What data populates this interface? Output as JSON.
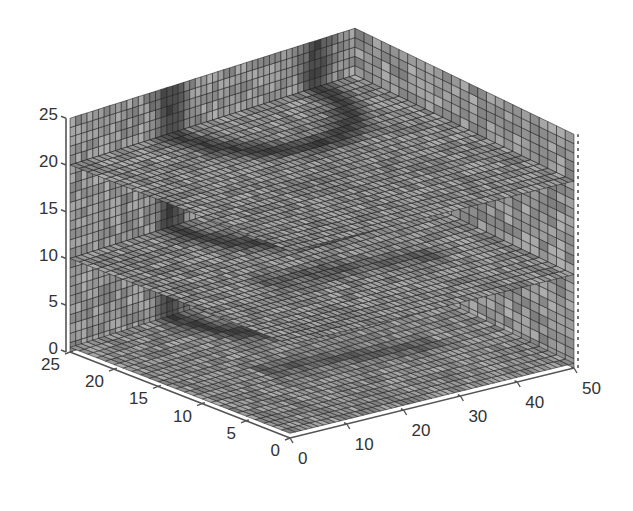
{
  "chart_data": {
    "type": "slice3d",
    "title": "",
    "xlabel": "",
    "ylabel": "",
    "zlabel": "",
    "xlim": [
      0,
      50
    ],
    "ylim": [
      0,
      25
    ],
    "zlim": [
      0,
      25
    ],
    "x_ticks": [
      0,
      10,
      20,
      30,
      40,
      50
    ],
    "y_ticks": [
      0,
      5,
      10,
      15,
      20,
      25
    ],
    "z_ticks": [
      0,
      5,
      10,
      15,
      20,
      25
    ],
    "grid_resolution": 1,
    "colormap": "gray",
    "slices": [
      {
        "plane": "x",
        "value": 50
      },
      {
        "plane": "y",
        "value": 25
      },
      {
        "plane": "z",
        "value": 20
      },
      {
        "plane": "z",
        "value": 10
      },
      {
        "plane": "z",
        "value": 0.5
      }
    ],
    "annotations": "Dark band features visible on slices forming a curved ridge near x≈20-35, y≈15-25",
    "grid": "dotted floor grid lines at axis ticks",
    "box": false
  },
  "projection": {
    "origin": [
      290,
      438
    ],
    "x50": [
      574,
      368
    ],
    "y25": [
      70,
      352
    ],
    "xy": [
      355,
      262
    ],
    "z_scale": 9.35
  },
  "colors": {
    "background": "#ffffff",
    "axis": "#555555",
    "mesh_line": "#1e1e1e",
    "face_light": "#9a9a9a",
    "face_dark": "#6e6e6e",
    "feature": "#1a1a1a"
  }
}
